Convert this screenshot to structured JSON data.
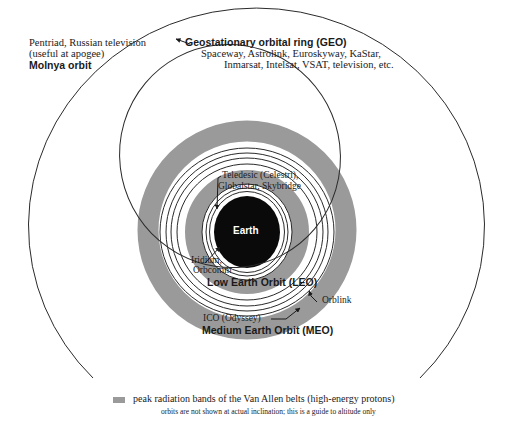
{
  "diagram": {
    "center_label": "Earth",
    "orbits": [
      {
        "name": "Geostationary orbital ring (GEO)",
        "systems": "Spaceway, Astrolink, Euroskyway, KaStar,",
        "systems_line2": "Inmarsat, Intelsat, VSAT, television, etc."
      },
      {
        "name": "Molnya orbit",
        "systems": "Pentriad, Russian television",
        "systems_line2": "(useful at apogee)"
      },
      {
        "name": "Low Earth Orbit (LEO)",
        "systems_a": "Teledesic (Celestri),",
        "systems_a_line2": "Globalstar, Skybridge",
        "systems_b": "Iridium,",
        "systems_b_line2": "Orbcomm"
      },
      {
        "name": "Medium Earth Orbit (MEO)",
        "systems_a": "ICO (Odyssey)",
        "systems_b": "Orblink"
      }
    ],
    "legend": {
      "swatch_color": "#9a9a9a",
      "label": "peak radiation bands of the Van Allen belts (high-energy protons)",
      "note": "orbits are not shown at actual inclination; this is a guide to altitude only"
    },
    "colors": {
      "earth": "#0a0a0a",
      "radiation_band": "#9a9a9a",
      "orbit_line": "#2a2a2a",
      "background": "#ffffff"
    }
  }
}
